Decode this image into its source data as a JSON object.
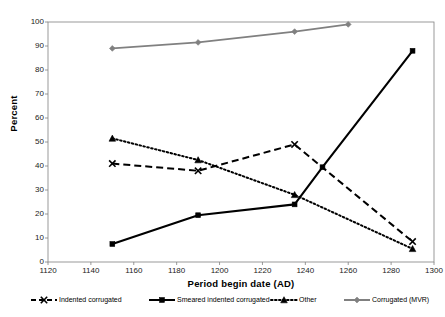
{
  "chart_data": {
    "type": "line",
    "title": "",
    "xlabel": "Period begin date (AD)",
    "ylabel": "Percent",
    "xlim": [
      1120,
      1300
    ],
    "ylim": [
      0,
      100
    ],
    "xticks": [
      1120,
      1140,
      1160,
      1180,
      1200,
      1220,
      1240,
      1260,
      1280,
      1300
    ],
    "yticks": [
      0,
      10,
      20,
      30,
      40,
      50,
      60,
      70,
      80,
      90,
      100
    ],
    "grid": false,
    "legend_position": "bottom",
    "series": [
      {
        "name": "Indented corrugated",
        "marker": "x",
        "linestyle": "dashed",
        "color": "#000000",
        "x": [
          1150,
          1190,
          1235,
          1290
        ],
        "y": [
          41,
          38,
          49,
          8.5
        ]
      },
      {
        "name": "Smeared indented corrugated",
        "marker": "square",
        "linestyle": "solid",
        "color": "#000000",
        "x": [
          1150,
          1190,
          1235,
          1248,
          1290
        ],
        "y": [
          7.5,
          19.5,
          24,
          39.5,
          88
        ]
      },
      {
        "name": "Other",
        "marker": "triangle",
        "linestyle": "dotted",
        "color": "#000000",
        "x": [
          1150,
          1190,
          1235,
          1290
        ],
        "y": [
          51.5,
          42.5,
          28,
          5.5
        ]
      },
      {
        "name": "Corrugated (MVR)",
        "marker": "diamond",
        "linestyle": "solid",
        "color": "#808080",
        "x": [
          1150,
          1190,
          1235,
          1260
        ],
        "y": [
          89,
          91.5,
          96,
          99
        ]
      }
    ]
  },
  "axes": {
    "y_label": "Percent",
    "x_label": "Period begin date (AD)",
    "y_tick_labels": [
      "100",
      "90",
      "80",
      "70",
      "60",
      "50",
      "40",
      "30",
      "20",
      "10",
      "0"
    ],
    "x_tick_labels": [
      "1120",
      "1140",
      "1160",
      "1180",
      "1200",
      "1220",
      "1240",
      "1260",
      "1280",
      "1300"
    ]
  },
  "legend": {
    "items": [
      {
        "label": "Indented corrugated"
      },
      {
        "label": "Smeared indented corrugated"
      },
      {
        "label": "Other"
      },
      {
        "label": "Corrugated (MVR)"
      }
    ]
  },
  "colors": {
    "series_black": "#000000",
    "series_gray": "#808080",
    "frame": "#808080",
    "text": "#000000"
  }
}
